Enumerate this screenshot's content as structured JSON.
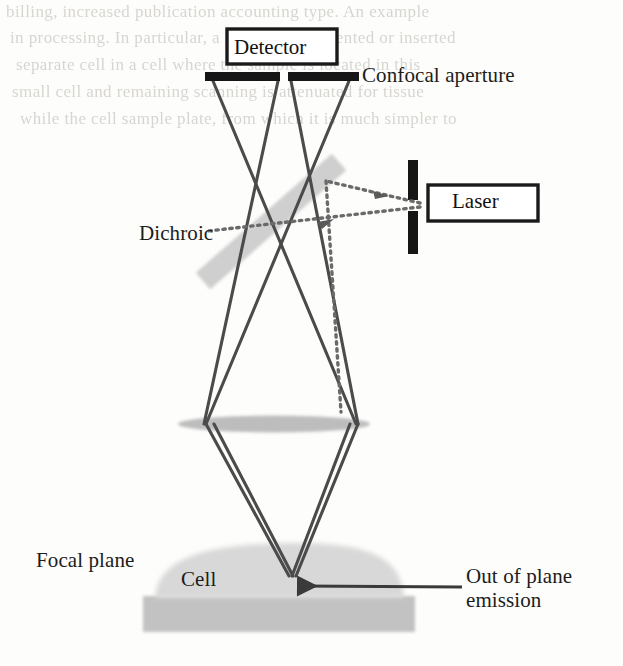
{
  "figure": {
    "type": "optical-ray-diagram"
  },
  "components": {
    "detector_label": "Detector",
    "laser_label": "Laser",
    "confocal_aperture_label": "Confocal aperture",
    "dichroic_label": "Dichroic",
    "focal_plane_label": "Focal plane",
    "cell_label": "Cell",
    "out_of_plane_label_line1": "Out of plane",
    "out_of_plane_label_line2": "emission"
  },
  "colors": {
    "ink": "#1c1c1c",
    "ray": "#4a4a4a",
    "dashed_ray": "#6d6d6d",
    "dichroic_fill": "#cfcfcf",
    "lens_fill": "#bcbcbc",
    "cell_fill": "#d6d6d6",
    "substrate_fill": "#c2c2c2",
    "aperture_black": "#161616",
    "page": "#fdfdfb"
  },
  "background_bleed": [
    "billing, increased publication accounting type. An example",
    "in processing. In particular, a substance is oriented or inserted",
    "separate cell in a cell where the sample is located in this",
    "small cell and remaining scanning is attenuated for tissue",
    "while the cell sample plate, from which it is much simpler to"
  ]
}
